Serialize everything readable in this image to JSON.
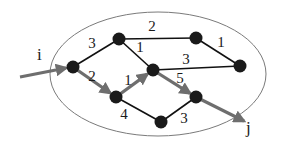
{
  "diagram": {
    "type": "graph",
    "colors": {
      "edge": "#111111",
      "highlight": "#6e6e6e",
      "node": "#1a1a1a",
      "ellipse": "#7a7a7a"
    },
    "ellipse": {
      "cx": 158,
      "cy": 74,
      "rx": 108,
      "ry": 62
    },
    "nodes": [
      {
        "id": "n_i",
        "x": 73,
        "y": 67
      },
      {
        "id": "n_top_left",
        "x": 119,
        "y": 39
      },
      {
        "id": "n_top_right",
        "x": 196,
        "y": 38
      },
      {
        "id": "n_right",
        "x": 240,
        "y": 66
      },
      {
        "id": "n_center",
        "x": 153,
        "y": 70
      },
      {
        "id": "n_lower_left",
        "x": 116,
        "y": 97
      },
      {
        "id": "n_lower_right",
        "x": 196,
        "y": 97
      },
      {
        "id": "n_bottom",
        "x": 161,
        "y": 122
      }
    ],
    "edges": [
      {
        "from": "n_i",
        "to": "n_top_left",
        "weight": "3",
        "highlighted": false,
        "label_x": 92,
        "label_y": 48
      },
      {
        "from": "n_i",
        "to": "n_lower_left",
        "weight": "2",
        "highlighted": true,
        "label_x": 92,
        "label_y": 81
      },
      {
        "from": "n_top_left",
        "to": "n_top_right",
        "weight": "2",
        "highlighted": false,
        "label_x": 152,
        "label_y": 31
      },
      {
        "from": "n_top_left",
        "to": "n_center",
        "weight": "1",
        "highlighted": false,
        "label_x": 140,
        "label_y": 52
      },
      {
        "from": "n_top_right",
        "to": "n_right",
        "weight": "1",
        "highlighted": false,
        "label_x": 221,
        "label_y": 47
      },
      {
        "from": "n_center",
        "to": "n_right",
        "weight": "3",
        "highlighted": false,
        "label_x": 186,
        "label_y": 64
      },
      {
        "from": "n_lower_left",
        "to": "n_center",
        "weight": "1",
        "highlighted": true,
        "label_x": 128,
        "label_y": 85
      },
      {
        "from": "n_center",
        "to": "n_lower_right",
        "weight": "5",
        "highlighted": true,
        "label_x": 180,
        "label_y": 83
      },
      {
        "from": "n_lower_left",
        "to": "n_bottom",
        "weight": "4",
        "highlighted": false,
        "label_x": 124,
        "label_y": 119
      },
      {
        "from": "n_bottom",
        "to": "n_lower_right",
        "weight": "3",
        "highlighted": false,
        "label_x": 184,
        "label_y": 123
      }
    ],
    "entry": {
      "label": "i",
      "label_x": 37,
      "label_y": 60,
      "arrow_from_x": 20,
      "arrow_from_y": 77,
      "arrow_to_x": 66,
      "arrow_to_y": 68
    },
    "exit": {
      "label": "j",
      "label_x": 246,
      "label_y": 133,
      "arrow_from_x": 196,
      "arrow_from_y": 97,
      "arrow_to_x": 244,
      "arrow_to_y": 121
    }
  }
}
